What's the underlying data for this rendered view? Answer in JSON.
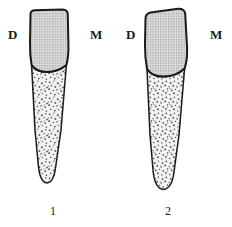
{
  "figure": {
    "kind": "anatomical-line-drawing",
    "background_color": "#ffffff",
    "outline_color": "#1a1a1a",
    "crown_fill_color": "#d8d8d8",
    "root_fill_color": "#efefef",
    "stipple_color": "#555555"
  },
  "specimens": [
    {
      "number": "1",
      "side_labels": {
        "left": "D",
        "right": "M"
      },
      "crown": {
        "texture": "fine-regular-dot-grid",
        "incisal_edge": "flat-with-rounded-corners"
      },
      "root": {
        "texture": "coarse-irregular-stipple",
        "apex": "narrow-rounded"
      },
      "cervical_line": "concave-up-curve"
    },
    {
      "number": "2",
      "side_labels": {
        "left": "D",
        "right": "M"
      },
      "crown": {
        "texture": "fine-regular-dot-grid",
        "incisal_edge": "flat-slightly-tilted"
      },
      "root": {
        "texture": "coarse-irregular-stipple",
        "apex": "blunt-rounded"
      },
      "cervical_line": "concave-up-curve"
    }
  ]
}
